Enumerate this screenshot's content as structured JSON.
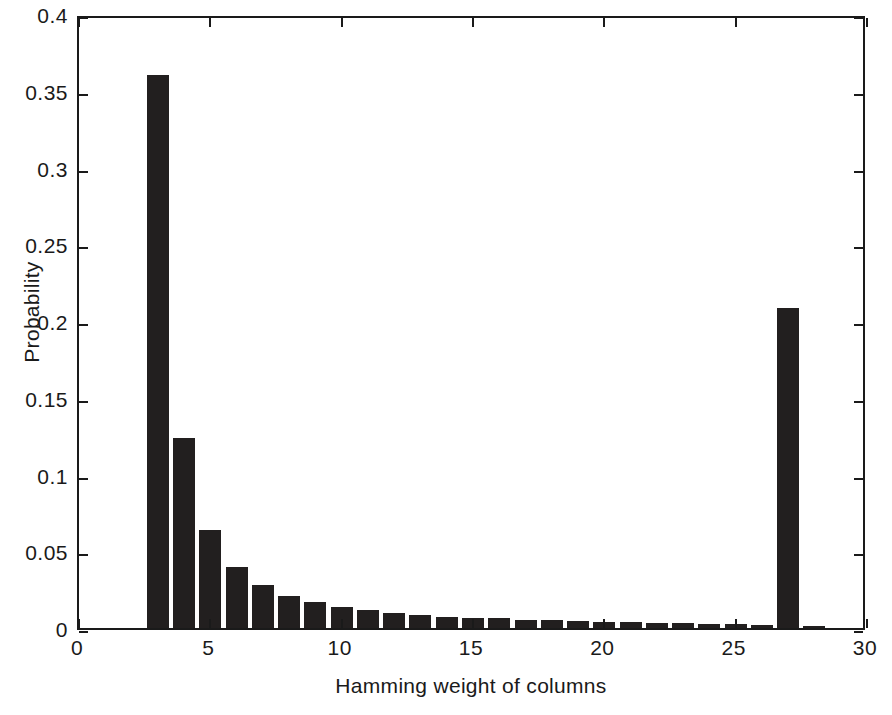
{
  "chart_data": {
    "type": "bar",
    "title": "",
    "xlabel": "Hamming weight of columns",
    "ylabel": "Probability",
    "xlim": [
      0,
      30
    ],
    "ylim": [
      0,
      0.4
    ],
    "grid": false,
    "legend": null,
    "bar_color": "#221f1f",
    "axis_color": "#1a1a1a",
    "background": "#ffffff",
    "xticks": [
      0,
      5,
      10,
      15,
      20,
      25,
      30
    ],
    "xtick_labels": [
      "0",
      "5",
      "10",
      "15",
      "20",
      "25",
      "30"
    ],
    "yticks": [
      0,
      0.05,
      0.1,
      0.15,
      0.2,
      0.25,
      0.3,
      0.35,
      0.4
    ],
    "ytick_labels": [
      "0",
      "0.05",
      "0.1",
      "0.15",
      "0.2",
      "0.25",
      "0.3",
      "0.35",
      "0.4"
    ],
    "categories": [
      3,
      4,
      5,
      6,
      7,
      8,
      9,
      10,
      11,
      12,
      13,
      14,
      15,
      16,
      17,
      18,
      19,
      20,
      21,
      22,
      23,
      24,
      25,
      26,
      27,
      28
    ],
    "values": [
      0.36,
      0.124,
      0.064,
      0.04,
      0.028,
      0.021,
      0.017,
      0.014,
      0.0115,
      0.0095,
      0.0085,
      0.0075,
      0.0068,
      0.0062,
      0.0055,
      0.005,
      0.0045,
      0.0042,
      0.0038,
      0.0034,
      0.0031,
      0.0028,
      0.0025,
      0.0022,
      0.2085,
      0.0015
    ],
    "bar_width_units": 0.84
  },
  "figure": {
    "width": 892,
    "height": 715
  }
}
